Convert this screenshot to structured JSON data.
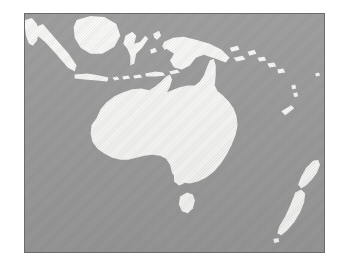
{
  "figure": {
    "kind": "map",
    "title": "Oceania region map",
    "caption": "",
    "region_name": "Oceania",
    "projection_hint": "equirectangular",
    "frame": {
      "border_color": "#6b6b6b",
      "border_width_px": 1,
      "left_px": 24,
      "top_px": 13,
      "width_px": 301,
      "height_px": 240
    }
  },
  "colors": {
    "page_background": "#ffffff",
    "sea": "#9b9b9b",
    "land": "#f8f8f6",
    "frame_border": "#6b6b6b"
  },
  "legend": {
    "visible": false,
    "entries": [
      {
        "label": "Land",
        "color": "#f8f8f6"
      },
      {
        "label": "Sea",
        "color": "#9b9b9b"
      }
    ]
  },
  "labels": {
    "visible": false,
    "items": []
  },
  "landmasses": [
    {
      "name": "Australia",
      "kind": "continent"
    },
    {
      "name": "Tasmania",
      "kind": "island"
    },
    {
      "name": "New Guinea",
      "kind": "island"
    },
    {
      "name": "New Zealand North Island",
      "kind": "island"
    },
    {
      "name": "New Zealand South Island",
      "kind": "island"
    },
    {
      "name": "Borneo",
      "kind": "island"
    },
    {
      "name": "Sumatra",
      "kind": "island"
    },
    {
      "name": "Java",
      "kind": "island"
    },
    {
      "name": "Sulawesi",
      "kind": "island"
    },
    {
      "name": "Malay Peninsula",
      "kind": "peninsula"
    },
    {
      "name": "Lesser Sunda Islands",
      "kind": "archipelago"
    },
    {
      "name": "Solomon Islands",
      "kind": "archipelago"
    },
    {
      "name": "New Caledonia",
      "kind": "island"
    },
    {
      "name": "Vanuatu",
      "kind": "archipelago"
    },
    {
      "name": "Fiji",
      "kind": "archipelago"
    }
  ]
}
